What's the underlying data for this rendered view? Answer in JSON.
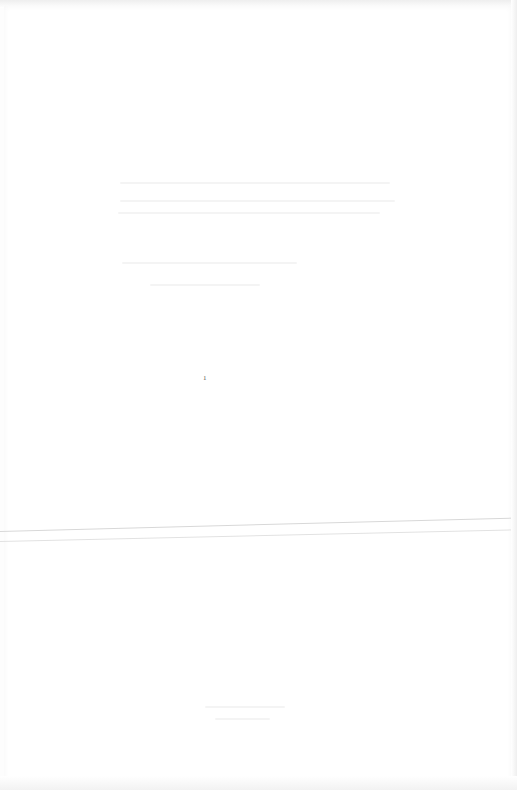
{
  "document": {
    "type": "scanned page (overexposed, text illegible)",
    "page_mark": "1"
  }
}
